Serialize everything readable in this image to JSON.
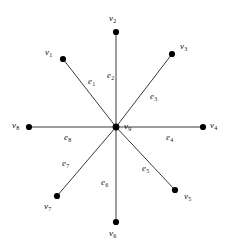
{
  "figure": {
    "type": "star-graph",
    "background_color": "#ffffff",
    "line_color": "#3a3a3a",
    "vertex_color": "#000000"
  },
  "graph": {
    "center": {
      "id": "v9",
      "label": "v",
      "subscript": "9",
      "x": 116,
      "y": 127,
      "radius": 3.4
    },
    "vertices": [
      {
        "id": "v1",
        "label": "v",
        "subscript": "1",
        "x": 63,
        "y": 59,
        "radius": 3.1,
        "label_x": 45,
        "label_y": 48
      },
      {
        "id": "v2",
        "label": "v",
        "subscript": "2",
        "x": 116,
        "y": 32,
        "radius": 3.1,
        "label_x": 109,
        "label_y": 14
      },
      {
        "id": "v3",
        "label": "v",
        "subscript": "3",
        "x": 172,
        "y": 54,
        "radius": 3.1,
        "label_x": 180,
        "label_y": 42
      },
      {
        "id": "v4",
        "label": "v",
        "subscript": "4",
        "x": 203,
        "y": 127,
        "radius": 3.1,
        "label_x": 210,
        "label_y": 121
      },
      {
        "id": "v5",
        "label": "v",
        "subscript": "5",
        "x": 175,
        "y": 190,
        "radius": 3.1,
        "label_x": 184,
        "label_y": 192
      },
      {
        "id": "v6",
        "label": "v",
        "subscript": "6",
        "x": 116,
        "y": 222,
        "radius": 3.1,
        "label_x": 109,
        "label_y": 229
      },
      {
        "id": "v7",
        "label": "v",
        "subscript": "7",
        "x": 57,
        "y": 196,
        "radius": 3.1,
        "label_x": 44,
        "label_y": 202
      },
      {
        "id": "v8",
        "label": "v",
        "subscript": "8",
        "x": 29,
        "y": 127,
        "radius": 3.1,
        "label_x": 12,
        "label_y": 121
      }
    ],
    "edges": [
      {
        "id": "e1",
        "label": "e",
        "subscript": "1",
        "from": "v9",
        "to": "v1",
        "label_x": 88,
        "label_y": 77
      },
      {
        "id": "e2",
        "label": "e",
        "subscript": "2",
        "from": "v9",
        "to": "v2",
        "label_x": 107,
        "label_y": 71
      },
      {
        "id": "e3",
        "label": "e",
        "subscript": "3",
        "from": "v9",
        "to": "v3",
        "label_x": 150,
        "label_y": 92
      },
      {
        "id": "e4",
        "label": "e",
        "subscript": "4",
        "from": "v9",
        "to": "v4",
        "label_x": 166,
        "label_y": 133
      },
      {
        "id": "e5",
        "label": "e",
        "subscript": "5",
        "from": "v9",
        "to": "v5",
        "label_x": 142,
        "label_y": 164
      },
      {
        "id": "e6",
        "label": "e",
        "subscript": "6",
        "from": "v9",
        "to": "v6",
        "label_x": 101,
        "label_y": 178
      },
      {
        "id": "e7",
        "label": "e",
        "subscript": "7",
        "from": "v9",
        "to": "v7",
        "label_x": 62,
        "label_y": 159
      },
      {
        "id": "e8",
        "label": "e",
        "subscript": "8",
        "from": "v9",
        "to": "v8",
        "label_x": 64,
        "label_y": 133
      }
    ],
    "center_label_offset": {
      "x": 8,
      "y": -5
    }
  }
}
